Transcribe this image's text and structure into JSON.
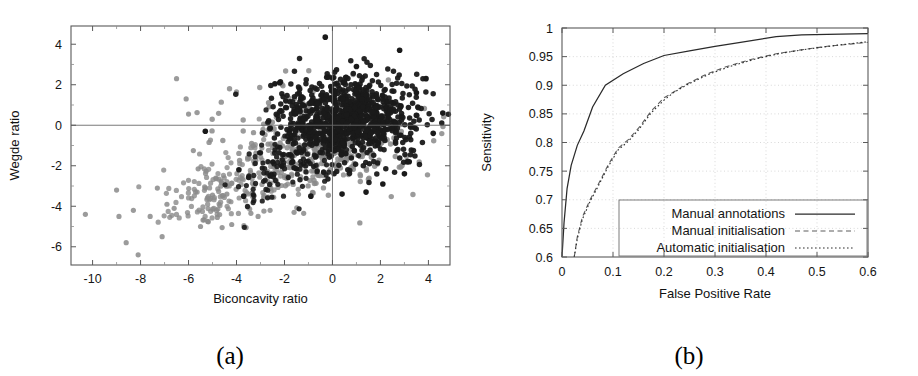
{
  "figure": {
    "panels": [
      {
        "key": "a",
        "caption": "(a)"
      },
      {
        "key": "b",
        "caption": "(b)"
      }
    ]
  },
  "panel_a": {
    "caption": "(a)",
    "xlabel": "Biconcavity ratio",
    "ylabel": "Wegde ratio",
    "xticks": [
      "-10",
      "-8",
      "-6",
      "-4",
      "-2",
      "0",
      "2",
      "4"
    ],
    "yticks": [
      "4",
      "2",
      "0",
      "-2",
      "-4",
      "-6"
    ],
    "colors": {
      "dark_group": "#1a1a1a",
      "gray_group": "#8a8a8a",
      "axis": "#5a5a5a"
    }
  },
  "panel_b": {
    "caption": "(b)",
    "xlabel": "False Positive Rate",
    "ylabel": "Sensitivity",
    "xticks": [
      "0",
      "0.1",
      "0.2",
      "0.3",
      "0.4",
      "0.5",
      "0.6"
    ],
    "yticks": [
      "0.6",
      "0.65",
      "0.7",
      "0.75",
      "0.8",
      "0.85",
      "0.9",
      "0.95",
      "1"
    ],
    "legend": [
      {
        "label": "Manual annotations",
        "style": "solid"
      },
      {
        "label": "Manual initialisation",
        "style": "dashed"
      },
      {
        "label": "Automatic initialisation",
        "style": "dotted"
      }
    ]
  },
  "chart_data": [
    {
      "type": "scatter",
      "panel": "(a)",
      "title": "",
      "xlabel": "Biconcavity ratio",
      "ylabel": "Wegde ratio",
      "xlim": [
        -10.9,
        4.9
      ],
      "ylim": [
        -6.9,
        4.9
      ],
      "xticks": [
        -10,
        -8,
        -6,
        -4,
        -2,
        0,
        2,
        4
      ],
      "yticks": [
        -6,
        -4,
        -2,
        0,
        2,
        4
      ],
      "grid": false,
      "reference_lines": {
        "x": 0,
        "y": 0
      },
      "legend": "none",
      "series": [
        {
          "name": "dark-group",
          "color": "#1a1a1a",
          "marker": "filled-circle",
          "n_points": 980,
          "description": "Dense elliptical cloud centred near (0.6, 0.3) with sigma ~1.4 in x and ~1.0 in y, plus a scattered tail extending to the lower-left toward (-4, -3).",
          "cluster": {
            "cx": 0.6,
            "cy": 0.3,
            "sx": 1.35,
            "sy": 1.0
          },
          "outliers": [
            [
              -5.3,
              -0.3
            ],
            [
              -3.9,
              -2.2
            ],
            [
              -3.7,
              -3.5
            ],
            [
              -2.6,
              -2.5
            ],
            [
              -2.2,
              2.1
            ],
            [
              -1.6,
              -2.1
            ],
            [
              -0.3,
              4.35
            ],
            [
              1.4,
              -3.3
            ],
            [
              2.8,
              3.7
            ],
            [
              3.0,
              -2.4
            ],
            [
              3.2,
              -1.8
            ],
            [
              3.5,
              1.6
            ],
            [
              3.9,
              2.3
            ],
            [
              4.2,
              -0.4
            ],
            [
              4.6,
              0.6
            ],
            [
              -0.9,
              -3.5
            ],
            [
              0.4,
              -3.4
            ],
            [
              2.1,
              -2.9
            ],
            [
              -2.4,
              2.05
            ],
            [
              1.0,
              2.9
            ]
          ]
        },
        {
          "name": "gray-group",
          "color": "#8a8a8a",
          "marker": "filled-circle",
          "n_points": 430,
          "description": "Broad diffuse band sweeping from the lower-left (-10, -4.5) up through (-4, -2) into the central cluster region near (0, -0.5); sparse at the far left, dense where it overlaps the dark cloud.",
          "cluster": {
            "cx": -0.3,
            "cy": -0.8,
            "sx": 1.9,
            "sy": 1.3
          },
          "outliers": [
            [
              -10.3,
              -4.4
            ],
            [
              -9.0,
              -3.2
            ],
            [
              -8.9,
              -4.5
            ],
            [
              -8.6,
              -5.8
            ],
            [
              -8.3,
              -4.2
            ],
            [
              -8.1,
              -6.4
            ],
            [
              -7.6,
              -4.5
            ],
            [
              -7.3,
              -3.1
            ],
            [
              -7.1,
              -5.5
            ],
            [
              -6.9,
              -3.9
            ],
            [
              -6.6,
              -4.1
            ],
            [
              -6.5,
              2.3
            ],
            [
              -6.1,
              1.3
            ],
            [
              -6.0,
              0.55
            ],
            [
              -5.8,
              -1.25
            ],
            [
              -5.6,
              -2.15
            ],
            [
              -5.5,
              -5.0
            ],
            [
              -5.3,
              -3.1
            ],
            [
              -5.2,
              -4.75
            ],
            [
              -5.0,
              -3.45
            ],
            [
              -4.8,
              -4.55
            ],
            [
              -4.6,
              -5.05
            ],
            [
              -4.4,
              -3.4
            ],
            [
              -4.2,
              -4.9
            ],
            [
              -4.0,
              1.65
            ],
            [
              -3.6,
              -5.05
            ],
            [
              -3.4,
              -4.35
            ],
            [
              -3.1,
              -4.5
            ],
            [
              -2.6,
              -4.2
            ],
            [
              -1.6,
              -4.3
            ],
            [
              -1.2,
              -4.35
            ]
          ]
        }
      ]
    },
    {
      "type": "line",
      "panel": "(b)",
      "title": "",
      "xlabel": "False Positive Rate",
      "ylabel": "Sensitivity",
      "xlim": [
        0,
        0.6
      ],
      "ylim": [
        0.6,
        1.0
      ],
      "xticks": [
        0,
        0.1,
        0.2,
        0.3,
        0.4,
        0.5,
        0.6
      ],
      "yticks": [
        0.6,
        0.65,
        0.7,
        0.75,
        0.8,
        0.85,
        0.9,
        0.95,
        1.0
      ],
      "grid": true,
      "legend_position": "lower-right",
      "series": [
        {
          "name": "Manual annotations",
          "style": "solid",
          "color": "#2a2a2a",
          "x": [
            0.0,
            0.004,
            0.01,
            0.018,
            0.03,
            0.043,
            0.06,
            0.085,
            0.12,
            0.16,
            0.2,
            0.25,
            0.3,
            0.35,
            0.42,
            0.47,
            0.52,
            0.6
          ],
          "y": [
            0.6,
            0.66,
            0.72,
            0.76,
            0.795,
            0.82,
            0.862,
            0.9,
            0.92,
            0.938,
            0.952,
            0.96,
            0.968,
            0.975,
            0.985,
            0.988,
            0.989,
            0.99
          ]
        },
        {
          "name": "Manual initialisation",
          "style": "dashed",
          "color": "#5d5d5d",
          "x": [
            0.024,
            0.03,
            0.04,
            0.055,
            0.07,
            0.09,
            0.11,
            0.13,
            0.15,
            0.175,
            0.2,
            0.215,
            0.24,
            0.28,
            0.32,
            0.37,
            0.42,
            0.47,
            0.52,
            0.6
          ],
          "y": [
            0.6,
            0.635,
            0.67,
            0.7,
            0.725,
            0.76,
            0.79,
            0.805,
            0.825,
            0.855,
            0.878,
            0.886,
            0.9,
            0.918,
            0.932,
            0.945,
            0.955,
            0.962,
            0.968,
            0.975
          ]
        },
        {
          "name": "Automatic initialisation",
          "style": "dotted",
          "color": "#2f2f2f",
          "x": [
            0.024,
            0.03,
            0.04,
            0.055,
            0.07,
            0.09,
            0.11,
            0.13,
            0.15,
            0.175,
            0.2,
            0.22,
            0.25,
            0.29,
            0.33,
            0.38,
            0.43,
            0.48,
            0.54,
            0.6
          ],
          "y": [
            0.6,
            0.632,
            0.666,
            0.697,
            0.722,
            0.757,
            0.787,
            0.802,
            0.822,
            0.852,
            0.874,
            0.888,
            0.903,
            0.92,
            0.933,
            0.946,
            0.956,
            0.963,
            0.97,
            0.976
          ]
        }
      ]
    }
  ]
}
